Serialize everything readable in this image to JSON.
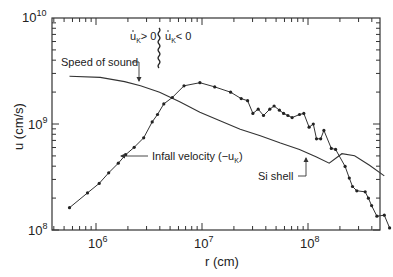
{
  "chart_data": {
    "type": "line",
    "title": "",
    "xlabel": "r (cm)",
    "ylabel": "u (cm/s)",
    "xscale": "log",
    "yscale": "log",
    "xlim": [
      450000.0,
      500000000.0
    ],
    "ylim": [
      100000000.0,
      10000000000.0
    ],
    "x_ticks": [
      {
        "value": 1000000.0,
        "label_base": "10",
        "label_exp": "6"
      },
      {
        "value": 10000000.0,
        "label_base": "10",
        "label_exp": "7"
      },
      {
        "value": 100000000.0,
        "label_base": "10",
        "label_exp": "8"
      }
    ],
    "y_ticks": [
      {
        "value": 100000000.0,
        "label_base": "10",
        "label_exp": "8"
      },
      {
        "value": 1000000000.0,
        "label_base": "10",
        "label_exp": "9"
      },
      {
        "value": 10000000000.0,
        "label_base": "10",
        "label_exp": "10"
      }
    ],
    "grid": false,
    "series": [
      {
        "name": "Speed of sound",
        "style": "solid line",
        "log_points": [
          [
            5.75,
            9.45
          ],
          [
            6.04,
            9.44
          ],
          [
            6.27,
            9.4
          ],
          [
            6.42,
            9.36
          ],
          [
            6.6,
            9.3
          ],
          [
            6.79,
            9.21
          ],
          [
            6.98,
            9.11
          ],
          [
            7.17,
            9.03
          ],
          [
            7.36,
            8.95
          ],
          [
            7.55,
            8.89
          ],
          [
            7.74,
            8.82
          ],
          [
            7.92,
            8.76
          ],
          [
            8.08,
            8.69
          ],
          [
            8.2,
            8.63
          ],
          [
            8.32,
            8.72
          ],
          [
            8.44,
            8.7
          ],
          [
            8.58,
            8.61
          ],
          [
            8.72,
            8.51
          ]
        ]
      },
      {
        "name": "Infall velocity (-u_K)",
        "style": "line with dot markers",
        "log_points": [
          [
            5.75,
            8.21
          ],
          [
            5.92,
            8.35
          ],
          [
            6.03,
            8.44
          ],
          [
            6.12,
            8.54
          ],
          [
            6.21,
            8.63
          ],
          [
            6.28,
            8.71
          ],
          [
            6.36,
            8.78
          ],
          [
            6.45,
            8.87
          ],
          [
            6.53,
            9.02
          ],
          [
            6.58,
            9.09
          ],
          [
            6.64,
            9.19
          ],
          [
            6.72,
            9.25
          ],
          [
            6.83,
            9.36
          ],
          [
            6.98,
            9.39
          ],
          [
            7.12,
            9.35
          ],
          [
            7.27,
            9.3
          ],
          [
            7.37,
            9.24
          ],
          [
            7.43,
            9.22
          ],
          [
            7.48,
            9.1
          ],
          [
            7.53,
            9.14
          ],
          [
            7.58,
            9.08
          ],
          [
            7.64,
            9.14
          ],
          [
            7.68,
            9.17
          ],
          [
            7.73,
            9.13
          ],
          [
            7.77,
            9.1
          ],
          [
            7.81,
            9.08
          ],
          [
            7.85,
            9.06
          ],
          [
            7.92,
            9.09
          ],
          [
            7.96,
            9.1
          ],
          [
            8.01,
            8.97
          ],
          [
            8.05,
            9.0
          ],
          [
            8.08,
            8.86
          ],
          [
            8.12,
            8.86
          ],
          [
            8.15,
            8.94
          ],
          [
            8.22,
            8.77
          ],
          [
            8.26,
            8.76
          ],
          [
            8.35,
            8.6
          ],
          [
            8.39,
            8.49
          ],
          [
            8.42,
            8.41
          ],
          [
            8.46,
            8.37
          ],
          [
            8.54,
            8.36
          ],
          [
            8.57,
            8.3
          ],
          [
            8.6,
            8.23
          ],
          [
            8.65,
            8.13
          ],
          [
            8.72,
            8.14
          ],
          [
            8.77,
            8.02
          ]
        ]
      }
    ],
    "annotations": [
      {
        "text": "Speed of sound",
        "arrow_to": "speed-of-sound curve"
      },
      {
        "text": "Infall velocity (−u",
        "subscript": "K",
        "suffix": ")",
        "arrow_to": "infall velocity curve"
      },
      {
        "text": "Si shell",
        "arrow_to": "dip in speed of sound curve"
      },
      {
        "text_left": "u̇",
        "sub_left": "K",
        "rel_left": "> 0",
        "text_right": "u̇",
        "sub_right": "K",
        "rel_right": "< 0",
        "divider": "vertical wavy line at sonic point"
      }
    ]
  },
  "labels": {
    "xlabel": "r (cm)",
    "ylabel": "u (cm/s)",
    "sound": "Speed of sound",
    "infall": "Infall velocity (−u",
    "infall_sub": "K",
    "infall_end": ")",
    "si_shell": "Si shell",
    "u_dot": "u",
    "k_sub": "K",
    "gt0": "> 0",
    "lt0": "< 0",
    "ten": "10",
    "e6": "6",
    "e7": "7",
    "e8": "8",
    "e9": "9",
    "e10": "10"
  }
}
